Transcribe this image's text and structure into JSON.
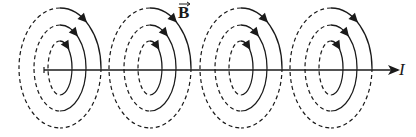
{
  "diagram": {
    "field_label": "B",
    "field_label_is_vector": true,
    "current_label": "I",
    "colors": {
      "stroke": "#1a1a1a",
      "background": "#ffffff"
    },
    "wire": {
      "y": 70,
      "x_start": 44,
      "x_end": 398,
      "arrow": "right"
    },
    "loop_sets": [
      {
        "cx": 60
      },
      {
        "cx": 150
      },
      {
        "cx": 241
      },
      {
        "cx": 331
      }
    ],
    "loops_per_set": [
      {
        "rx": 41,
        "ry": 60
      },
      {
        "rx": 26,
        "ry": 43
      },
      {
        "rx": 12,
        "ry": 27
      }
    ],
    "field_direction": "clockwise (viewed along current)",
    "back_half_style": "dashed",
    "front_half_style": "solid"
  }
}
